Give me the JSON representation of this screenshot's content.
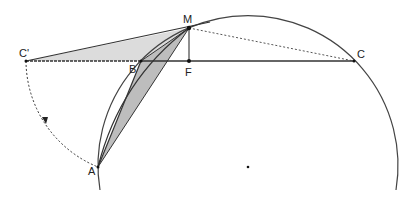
{
  "diagram": {
    "points": {
      "M": {
        "label": "M",
        "x": 189,
        "y": 28
      },
      "F": {
        "label": "F",
        "x": 189,
        "y": 61
      },
      "B": {
        "label": "B",
        "x": 141,
        "y": 61
      },
      "C_prime": {
        "label": "C'",
        "x": 26,
        "y": 61
      },
      "C": {
        "label": "C",
        "x": 354,
        "y": 61
      },
      "A": {
        "label": "A",
        "x": 98,
        "y": 167
      },
      "O": {
        "label": "",
        "x": 248,
        "y": 167
      }
    },
    "colors": {
      "stroke": "#333333",
      "light_fill": "#dcdcdc",
      "dark_fill": "#bdbdbd"
    },
    "elements": [
      "main circle through A, B, M, C (center O)",
      "line segment C' to C through B and F",
      "segment M F (perpendicular)",
      "shaded triangle C' B M",
      "shaded triangle A B M",
      "dashed segment M C",
      "dashed arc from C' to A centered at B with direction arrow",
      "line from C' through M extended"
    ]
  }
}
